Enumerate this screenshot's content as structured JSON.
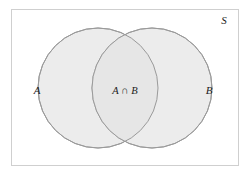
{
  "figure": {
    "kind": "venn-diagram",
    "background_color": "#ffffff",
    "universe": {
      "label": "S",
      "label_x": 224,
      "label_y": 24,
      "rect": {
        "x": 11,
        "y": 9,
        "width": 227,
        "height": 156
      },
      "border_color": "#cfcfcf",
      "fill_color": "#ffffff",
      "border_width": 1
    },
    "sets": [
      {
        "key": "A",
        "label": "A",
        "label_x": 37,
        "label_y": 94,
        "cx": 98,
        "cy": 88,
        "r": 60,
        "fill_color": "#ececec",
        "stroke_color": "#9a9a9a",
        "stroke_width": 1
      },
      {
        "key": "B",
        "label": "B",
        "label_x": 209,
        "label_y": 94,
        "cx": 152,
        "cy": 88,
        "r": 60,
        "fill_color": "#ececec",
        "stroke_color": "#9a9a9a",
        "stroke_width": 1
      }
    ],
    "intersection": {
      "label": "A ∩ B",
      "label_x": 125,
      "label_y": 94,
      "fill_color": "#e6e6e6",
      "upper_point": {
        "x": 125,
        "y": 38
      },
      "lower_point": {
        "x": 125,
        "y": 139
      }
    }
  }
}
